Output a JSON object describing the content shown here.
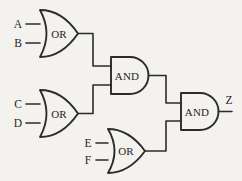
{
  "diagram": {
    "background_color": "#f4f2ee",
    "stroke_color": "#2b2b2b",
    "width": 242,
    "height": 181,
    "style": "hand-drawn logic gate schematic"
  },
  "inputs": [
    {
      "id": "in-a",
      "label": "A"
    },
    {
      "id": "in-b",
      "label": "B"
    },
    {
      "id": "in-c",
      "label": "C"
    },
    {
      "id": "in-d",
      "label": "D"
    },
    {
      "id": "in-e",
      "label": "E"
    },
    {
      "id": "in-f",
      "label": "F"
    }
  ],
  "outputs": [
    {
      "id": "out-z",
      "label": "Z"
    }
  ],
  "gates": [
    {
      "id": "or1",
      "type": "OR",
      "label": "OR",
      "inputs": [
        "A",
        "B"
      ]
    },
    {
      "id": "or2",
      "type": "OR",
      "label": "OR",
      "inputs": [
        "C",
        "D"
      ]
    },
    {
      "id": "or3",
      "type": "OR",
      "label": "OR",
      "inputs": [
        "E",
        "F"
      ]
    },
    {
      "id": "and1",
      "type": "AND",
      "label": "AND",
      "inputs": [
        "or1",
        "or2"
      ]
    },
    {
      "id": "and2",
      "type": "AND",
      "label": "AND",
      "inputs": [
        "and1",
        "or3"
      ]
    }
  ]
}
